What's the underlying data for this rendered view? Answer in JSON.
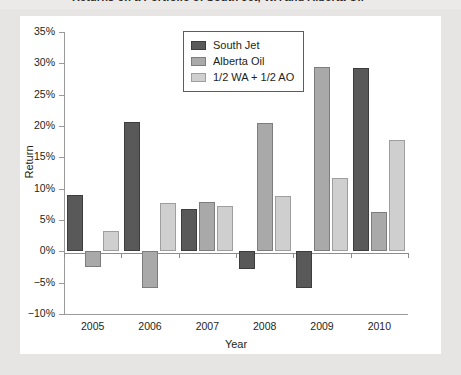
{
  "page": {
    "background_color": "#e6e5e3",
    "panel_color": "#ffffff",
    "title_partial": "Returns on a Portfolio of South Jet, WA and Alberta Oil"
  },
  "chart_data": {
    "type": "bar",
    "title": "",
    "xlabel": "Year",
    "ylabel": "Return",
    "categories": [
      "2005",
      "2006",
      "2007",
      "2008",
      "2009",
      "2010"
    ],
    "series": [
      {
        "name": "South Jet",
        "color": "#595959",
        "values": [
          9.0,
          20.7,
          6.7,
          -2.8,
          -5.9,
          29.3
        ]
      },
      {
        "name": "Alberta Oil",
        "color": "#a9a9a9",
        "values": [
          -2.5,
          -5.8,
          7.8,
          20.4,
          29.4,
          6.3
        ]
      },
      {
        "name": "1/2 WA + 1/2 AO",
        "color": "#cfcfcf",
        "values": [
          3.3,
          7.7,
          7.3,
          8.8,
          11.7,
          17.8
        ]
      }
    ],
    "ylim": [
      -10,
      35
    ],
    "ytick_values": [
      35,
      30,
      25,
      20,
      15,
      10,
      5,
      0,
      -5,
      -10
    ],
    "ytick_labels": [
      "35%",
      "30%",
      "25%",
      "20%",
      "15%",
      "10%",
      "5%",
      "0%",
      "−5%",
      "−10%"
    ],
    "grid": false,
    "legend_position": "top-center"
  }
}
